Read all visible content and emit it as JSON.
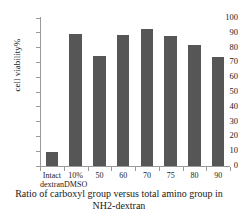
{
  "chart_data": {
    "type": "bar",
    "title": "",
    "xlabel": "Ratio of carboxyl group versus total amino group in NH2-dextran",
    "ylabel": "cell viability%",
    "categories": [
      "Intact dextran",
      "10% DMSO",
      "50",
      "60",
      "70",
      "75",
      "80",
      "90"
    ],
    "category_lines": [
      [
        "Intact",
        "dextran"
      ],
      [
        "10%",
        "DMSO"
      ],
      [
        "50"
      ],
      [
        "60"
      ],
      [
        "70"
      ],
      [
        "75"
      ],
      [
        "80"
      ],
      [
        "90"
      ]
    ],
    "values": [
      9.5,
      89,
      74.5,
      88.5,
      92.5,
      88,
      82,
      73.5
    ],
    "ylim": [
      0,
      100
    ],
    "ytick_labels": [
      "100",
      "90",
      "80",
      "70",
      "60",
      "50",
      "40",
      "30",
      "20",
      "10",
      "0"
    ],
    "ytick_values": [
      100,
      90,
      80,
      70,
      60,
      50,
      40,
      30,
      20,
      10,
      0
    ],
    "grid": false,
    "legend": false,
    "bar_color": "#565656",
    "axis_color": "#9a9a9a",
    "background_color": "#ffffff"
  },
  "axis_titles": {
    "y": "cell viability%",
    "x_line1": "Ratio of carboxyl  group versus total amino",
    "x_line2": "group in NH2-dextran"
  }
}
